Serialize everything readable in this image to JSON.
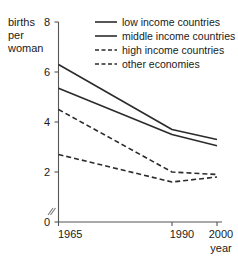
{
  "chart_data": {
    "type": "line",
    "title": "",
    "ylabel": "births per woman",
    "ylabel_lines": [
      "births",
      "per",
      "woman"
    ],
    "xlabel": "year",
    "x": [
      1965,
      1990,
      2000
    ],
    "xticklabels": [
      "1965",
      "1990",
      "2000"
    ],
    "yticklabels": [
      "0",
      "2",
      "4",
      "6",
      "8"
    ],
    "yticks": [
      0,
      2,
      4,
      6,
      8
    ],
    "ylim": [
      0,
      8
    ],
    "xlim": [
      1965,
      2000
    ],
    "grid": false,
    "legend_position": "top-right",
    "series": [
      {
        "name": "low income countries",
        "style": "solid",
        "values": [
          6.3,
          3.7,
          3.3
        ]
      },
      {
        "name": "middle income countries",
        "style": "solid",
        "values": [
          5.35,
          3.5,
          3.05
        ]
      },
      {
        "name": "high income countries",
        "style": "dashed",
        "values": [
          4.5,
          2.0,
          1.9
        ]
      },
      {
        "name": "other economies",
        "style": "dashed",
        "values": [
          2.7,
          1.6,
          1.8
        ]
      }
    ]
  },
  "axes": {
    "y_label_line1": "births",
    "y_label_line2": "per",
    "y_label_line3": "woman",
    "x_label": "year",
    "ytick_0": "0",
    "ytick_2": "2",
    "ytick_4": "4",
    "ytick_6": "6",
    "ytick_8": "8",
    "xtick_1965": "1965",
    "xtick_1990": "1990",
    "xtick_2000": "2000"
  },
  "legend": {
    "items": [
      {
        "label": "low income countries",
        "style": "solid"
      },
      {
        "label": "middle income countries",
        "style": "solid"
      },
      {
        "label": "high income countries",
        "style": "dashed"
      },
      {
        "label": "other economies",
        "style": "dashed"
      }
    ]
  },
  "colors": {
    "line": "#2b2b2b",
    "axis": "#555555",
    "text": "#1a1a1a",
    "background": "#ffffff"
  }
}
